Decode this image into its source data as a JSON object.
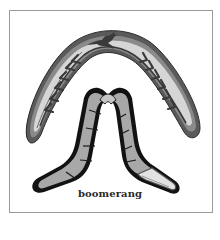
{
  "illustration": {
    "caption": "boomerang",
    "subjects": [
      {
        "name": "decorated-boomerang",
        "decorations": [
          "kangaroo",
          "chevrons"
        ]
      },
      {
        "name": "plain-boomerang",
        "decorations": [
          "segment-lines"
        ]
      }
    ],
    "colors": {
      "frame": "#9a9a9a",
      "outline": "#1a1a1a",
      "body_light": "#d8d8d8",
      "body_mid": "#a8a8a8",
      "rim": "#6a6a6a"
    }
  }
}
